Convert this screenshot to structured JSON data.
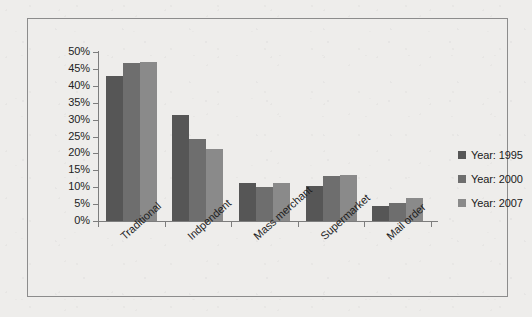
{
  "chart_data": {
    "type": "bar",
    "title": "",
    "subtitle": "",
    "xlabel": "",
    "ylabel": "",
    "ylim": [
      0,
      50
    ],
    "y_tick_labels": [
      "50%",
      "45%",
      "40%",
      "35%",
      "30%",
      "25%",
      "20%",
      "15%",
      "10%",
      "5%",
      "0%"
    ],
    "y_tick_values": [
      50,
      45,
      40,
      35,
      30,
      25,
      20,
      15,
      10,
      5,
      0
    ],
    "grid": false,
    "legend_position": "right",
    "value_suffix": "%",
    "categories": [
      "Traditional",
      "Indpendent",
      "Mass merchant",
      "Supermarket",
      "Mail order"
    ],
    "series": [
      {
        "name": "Year: 1995",
        "color": "#565656",
        "values": [
          42.8,
          31.5,
          11.2,
          10.5,
          4.4
        ]
      },
      {
        "name": "Year: 2000",
        "color": "#6e6e6e",
        "values": [
          46.8,
          24.3,
          10.2,
          13.4,
          5.2
        ]
      },
      {
        "name": "Year: 2007",
        "color": "#8a8a8a",
        "values": [
          47.0,
          21.2,
          11.3,
          13.7,
          6.8
        ]
      }
    ]
  },
  "legend": {
    "items": [
      {
        "label": "Year: 1995"
      },
      {
        "label": "Year: 2000"
      },
      {
        "label": "Year: 2007"
      }
    ]
  },
  "colors": {
    "series_1995": "#565656",
    "series_2000": "#6e6e6e",
    "series_2007": "#8a8a8a",
    "axis": "#7d7d7d",
    "frame_border": "#8c8c8c",
    "background": "#eeedeb",
    "text": "#1f1f1f"
  }
}
